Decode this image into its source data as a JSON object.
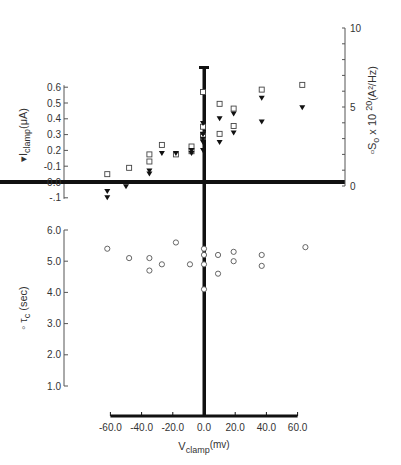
{
  "chart_data": [
    {
      "type": "scatter",
      "panel": "upper",
      "xlabel": "V_clamp (mv)",
      "ylabel_left": "I_clamp (μA)",
      "ylabel_right": "S_o x 10^20 (A²/Hz)",
      "x_ticks": [
        -60.0,
        -40.0,
        -20.0,
        0.0,
        20.0,
        40.0,
        60.0
      ],
      "x_tick_labels": [
        "-60.0",
        "-40.0",
        "-20.0",
        "0.0",
        "20.0",
        "40.0",
        "60.0"
      ],
      "y_left_ticks": [
        -0.1,
        0.0,
        0.1,
        0.2,
        0.3,
        0.4,
        0.5,
        0.6
      ],
      "y_left_tick_labels": [
        "-.1",
        "0.0",
        "-0.1",
        "0.2",
        "0.3",
        "0.4",
        "0.5",
        "0.6"
      ],
      "y_left_lim": [
        -0.1,
        0.6
      ],
      "y_right_ticks": [
        0,
        5,
        10
      ],
      "y_right_tick_labels": [
        "0",
        "5",
        "10"
      ],
      "y_right_lim": [
        0,
        10
      ],
      "grid": false,
      "series": [
        {
          "name": "I_clamp (μA)",
          "marker": "filled-triangle-down",
          "axis": "left",
          "points": [
            {
              "x": -62,
              "y": -0.06
            },
            {
              "x": -62,
              "y": -0.1
            },
            {
              "x": -50,
              "y": -0.03
            },
            {
              "x": -35,
              "y": 0.07
            },
            {
              "x": -35,
              "y": 0.05
            },
            {
              "x": -27,
              "y": 0.18
            },
            {
              "x": -18,
              "y": 0.18
            },
            {
              "x": -8,
              "y": 0.2
            },
            {
              "x": -8,
              "y": 0.18
            },
            {
              "x": 0,
              "y": 0.37
            },
            {
              "x": 0,
              "y": 0.3
            },
            {
              "x": 0,
              "y": 0.27
            },
            {
              "x": 0,
              "y": 0.25
            },
            {
              "x": 0,
              "y": 0.2
            },
            {
              "x": 10,
              "y": 0.4
            },
            {
              "x": 10,
              "y": 0.25
            },
            {
              "x": 19,
              "y": 0.43
            },
            {
              "x": 19,
              "y": 0.31
            },
            {
              "x": 37,
              "y": 0.53
            },
            {
              "x": 37,
              "y": 0.38
            },
            {
              "x": 63,
              "y": 0.47
            }
          ]
        },
        {
          "name": "S_o x 10^20 (A²/Hz)",
          "marker": "open-square",
          "axis": "right",
          "points": [
            {
              "x": -62,
              "y": 0.75
            },
            {
              "x": -48,
              "y": 1.15
            },
            {
              "x": -35,
              "y": 2.0
            },
            {
              "x": -35,
              "y": 1.55
            },
            {
              "x": -27,
              "y": 2.6
            },
            {
              "x": -18,
              "y": 2.0
            },
            {
              "x": -8,
              "y": 2.5
            },
            {
              "x": -8,
              "y": 2.2
            },
            {
              "x": 0,
              "y": 5.95
            },
            {
              "x": 0,
              "y": 3.75
            },
            {
              "x": 0,
              "y": 3.25
            },
            {
              "x": 0,
              "y": 3.1
            },
            {
              "x": 10,
              "y": 5.2
            },
            {
              "x": 10,
              "y": 3.3
            },
            {
              "x": 19,
              "y": 4.9
            },
            {
              "x": 19,
              "y": 3.8
            },
            {
              "x": 37,
              "y": 6.1
            },
            {
              "x": 63,
              "y": 6.4
            }
          ]
        }
      ]
    },
    {
      "type": "scatter",
      "panel": "lower",
      "xlabel": "V_clamp (mv)",
      "ylabel": "τ_c (sec)",
      "x_ticks": [
        -60.0,
        -40.0,
        -20.0,
        0.0,
        20.0,
        40.0,
        60.0
      ],
      "x_tick_labels": [
        "-60.0",
        "-40.0",
        "-20.0",
        "0.0",
        "20.0",
        "40.0",
        "60.0"
      ],
      "y_ticks": [
        1.0,
        2.0,
        3.0,
        4.0,
        5.0,
        6.0
      ],
      "y_tick_labels": [
        "1.0",
        "2.0",
        "3.0",
        "4.0",
        "5.0",
        "6.0"
      ],
      "ylim": [
        1.0,
        6.0
      ],
      "grid": false,
      "series": [
        {
          "name": "τ_c (sec)",
          "marker": "open-circle",
          "points": [
            {
              "x": -62,
              "y": 5.4
            },
            {
              "x": -48,
              "y": 5.1
            },
            {
              "x": -35,
              "y": 5.1
            },
            {
              "x": -35,
              "y": 4.7
            },
            {
              "x": -27,
              "y": 4.9
            },
            {
              "x": -18,
              "y": 5.6
            },
            {
              "x": -9,
              "y": 4.9
            },
            {
              "x": 0,
              "y": 5.4
            },
            {
              "x": 0,
              "y": 5.2
            },
            {
              "x": 0,
              "y": 4.9
            },
            {
              "x": 0,
              "y": 4.1
            },
            {
              "x": 9,
              "y": 5.2
            },
            {
              "x": 9,
              "y": 4.6
            },
            {
              "x": 19,
              "y": 5.3
            },
            {
              "x": 19,
              "y": 5.0
            },
            {
              "x": 37,
              "y": 5.2
            },
            {
              "x": 37,
              "y": 4.85
            },
            {
              "x": 65,
              "y": 5.45
            }
          ]
        }
      ]
    }
  ],
  "labels": {
    "upper_left_axis": "I",
    "upper_left_axis_sub": "clamp",
    "upper_left_axis_unit": "(μA)",
    "upper_right_axis": "S",
    "upper_right_axis_sub": "o",
    "upper_right_axis_rest": " x 10",
    "upper_right_axis_sup": "20",
    "upper_right_axis_unit": "(A²/Hz)",
    "lower_axis": "τ",
    "lower_axis_sub": "c",
    "lower_axis_unit": "(sec)",
    "x_axis": "V",
    "x_axis_sub": "clamp",
    "x_axis_unit": "(mv)"
  }
}
